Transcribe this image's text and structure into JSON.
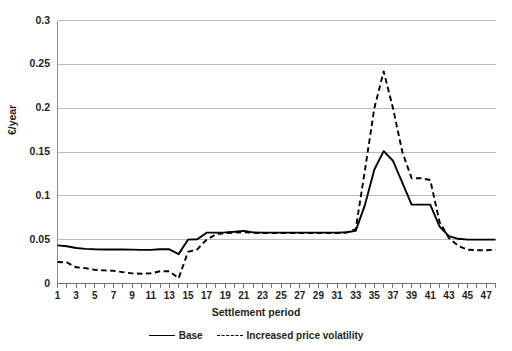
{
  "chart_data": {
    "type": "line",
    "title": "",
    "xlabel": "Settlement period",
    "ylabel": "€/year",
    "xlim": [
      1,
      48
    ],
    "ylim": [
      0,
      0.3
    ],
    "ytick_labels": [
      "0",
      "0.05",
      "0.1",
      "0.15",
      "0.2",
      "0.25",
      "0.3"
    ],
    "ytick_values": [
      0,
      0.05,
      0.1,
      0.15,
      0.2,
      0.25,
      0.3
    ],
    "xtick_labels": [
      "1",
      "3",
      "5",
      "7",
      "9",
      "11",
      "13",
      "15",
      "17",
      "19",
      "21",
      "23",
      "25",
      "27",
      "29",
      "31",
      "33",
      "35",
      "37",
      "39",
      "41",
      "43",
      "45",
      "47"
    ],
    "xtick_values": [
      1,
      3,
      5,
      7,
      9,
      11,
      13,
      15,
      17,
      19,
      21,
      23,
      25,
      27,
      29,
      31,
      33,
      35,
      37,
      39,
      41,
      43,
      45,
      47
    ],
    "grid": "horizontal",
    "legend_position": "bottom",
    "x": [
      1,
      2,
      3,
      4,
      5,
      6,
      7,
      8,
      9,
      10,
      11,
      12,
      13,
      14,
      15,
      16,
      17,
      18,
      19,
      20,
      21,
      22,
      23,
      24,
      25,
      26,
      27,
      28,
      29,
      30,
      31,
      32,
      33,
      34,
      35,
      36,
      37,
      38,
      39,
      40,
      41,
      42,
      43,
      44,
      45,
      46,
      47,
      48
    ],
    "series": [
      {
        "name": "Base",
        "style": "solid",
        "color": "#000000",
        "values": [
          0.0435,
          0.0425,
          0.0405,
          0.0395,
          0.039,
          0.0388,
          0.0387,
          0.0387,
          0.0386,
          0.0383,
          0.0383,
          0.039,
          0.039,
          0.0335,
          0.05,
          0.0505,
          0.058,
          0.058,
          0.0583,
          0.059,
          0.06,
          0.0583,
          0.058,
          0.058,
          0.058,
          0.058,
          0.058,
          0.058,
          0.058,
          0.058,
          0.058,
          0.0585,
          0.06,
          0.09,
          0.13,
          0.151,
          0.14,
          0.115,
          0.09,
          0.09,
          0.09,
          0.065,
          0.054,
          0.051,
          0.05,
          0.05,
          0.05,
          0.05
        ]
      },
      {
        "name": "Increased price volatility",
        "style": "dashed",
        "color": "#000000",
        "values": [
          0.0245,
          0.024,
          0.0185,
          0.0175,
          0.0155,
          0.015,
          0.0145,
          0.013,
          0.0115,
          0.0112,
          0.0115,
          0.014,
          0.014,
          0.006,
          0.036,
          0.039,
          0.05,
          0.056,
          0.0575,
          0.058,
          0.0585,
          0.0578,
          0.0575,
          0.0575,
          0.0575,
          0.0575,
          0.0575,
          0.0575,
          0.0575,
          0.0575,
          0.0575,
          0.058,
          0.062,
          0.13,
          0.2,
          0.242,
          0.2,
          0.15,
          0.12,
          0.12,
          0.118,
          0.07,
          0.052,
          0.043,
          0.0385,
          0.038,
          0.038,
          0.0385
        ]
      }
    ]
  },
  "legend": {
    "entries": [
      {
        "label": "Base"
      },
      {
        "label": "Increased price volatility"
      }
    ]
  }
}
